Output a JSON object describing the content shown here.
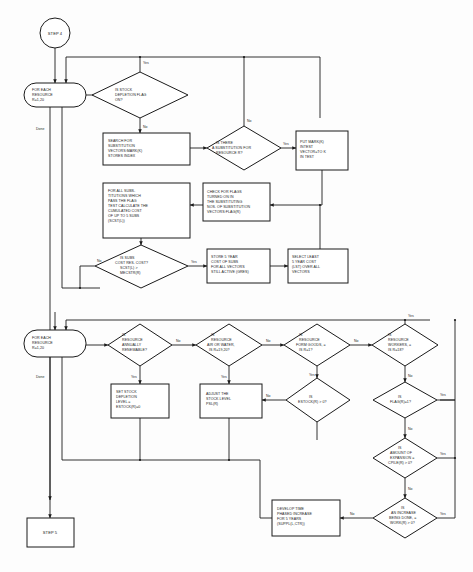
{
  "diagram": {
    "entry_label": "STEP 4",
    "exit_label": "STEP 5",
    "colors": {
      "stroke": "#1b1b1b",
      "fill": "#ffffff",
      "background": "#fdfdfd"
    }
  },
  "nodes": [
    {
      "id": "step4",
      "type": "terminator-circle",
      "lines": [
        "STEP 4"
      ]
    },
    {
      "id": "loop1",
      "type": "loop-capsule",
      "lines": [
        "FOR EACH",
        "RESOURCE",
        "R=1,20"
      ]
    },
    {
      "id": "d_stockflag",
      "type": "decision",
      "lines": [
        "IS STOCK",
        "DEPLETION FLAG",
        "ON?"
      ]
    },
    {
      "id": "p_search",
      "type": "process",
      "lines": [
        "SEARCH FOR",
        "SUBSTITUTION",
        "VECTORS:MARK(K)",
        "STORES INDEX"
      ]
    },
    {
      "id": "d_subexists",
      "type": "decision",
      "lines": [
        "IS THERE",
        "A SUBSTITUTION FOR",
        "RESOURCE R?"
      ]
    },
    {
      "id": "p_putmark",
      "type": "process",
      "lines": [
        "PUT MARK(K)",
        "INTEST",
        "VECTOR=TO K",
        "IN TEST"
      ]
    },
    {
      "id": "p_forallsubs",
      "type": "process",
      "lines": [
        "FOR ALL SUBS-",
        "TITUTIONS WHICH",
        "PASS THE FLAG",
        "TEST CALCULATE THE",
        "CUMULATED COST",
        "OF UP TO 5 SUBS",
        "(SCST(L))"
      ]
    },
    {
      "id": "p_checkflags",
      "type": "process",
      "lines": [
        "CHECK FOR FLAGS",
        "TURNED ON IN",
        "THE SUBSTITUTING",
        "NOS. OF SUBSTITUTION",
        "VECTORS:FLAG(R)"
      ]
    },
    {
      "id": "d_subscost",
      "type": "decision",
      "lines": [
        "IS SUBS",
        "COST RES. COST?",
        "SCST(L) >",
        "MECSTR(R)"
      ]
    },
    {
      "id": "p_store5yr",
      "type": "process",
      "lines": [
        "STORE 5 YEAR",
        "COST OF SUBS",
        "FOR ALL VECTORS",
        "STILL ACTIVE (GRES)"
      ]
    },
    {
      "id": "p_selectleast",
      "type": "process",
      "lines": [
        "SELECT LEAST",
        "5 YEAR COST",
        "(LST) OVER ALL",
        "VECTORS"
      ]
    },
    {
      "id": "loop2",
      "type": "loop-capsule",
      "lines": [
        "FOR EACH",
        "RESOURCE",
        "R=1,20"
      ]
    },
    {
      "id": "d_renewable",
      "type": "decision",
      "lines": [
        "IS",
        "RESOURCE",
        "ANNUALLY",
        "RENEWABLE?"
      ]
    },
    {
      "id": "d_airwater",
      "type": "decision",
      "lines": [
        "IS",
        "RESOURCE",
        "AIR OR WATER,",
        "IS R=19,20?"
      ]
    },
    {
      "id": "d_formgoods",
      "type": "decision",
      "lines": [
        "IS",
        "RESOURCE",
        "FORM GOODS, =",
        "IS R=1?"
      ]
    },
    {
      "id": "d_workers",
      "type": "decision",
      "lines": [
        "IS",
        "RESOURCE",
        "WORKERS, =",
        "IS R=18?"
      ]
    },
    {
      "id": "p_setstock",
      "type": "process",
      "lines": [
        "SET STOCK",
        "DEPLETION",
        "LEVEL =",
        "ESTOCK(R)=0"
      ]
    },
    {
      "id": "p_adjuststock",
      "type": "process",
      "lines": [
        "ADJUST THE",
        "STOCK LEVEL",
        "PSL(R)"
      ]
    },
    {
      "id": "d_estock",
      "type": "decision",
      "lines": [
        "IS",
        "ESTOCK(R) > 0?"
      ]
    },
    {
      "id": "d_flagr",
      "type": "decision",
      "lines": [
        "IS",
        "FLAG(R)=1?"
      ]
    },
    {
      "id": "d_expansion",
      "type": "decision",
      "lines": [
        "IS",
        "AMOUNT OF",
        "EXPANSION =",
        "CPILE(R) > 0?"
      ]
    },
    {
      "id": "d_increase",
      "type": "decision",
      "lines": [
        "IS",
        "AN INCREASE",
        "BEING DONE, =",
        "WORK(R) > 0?"
      ]
    },
    {
      "id": "p_develop",
      "type": "process",
      "lines": [
        "DEVELOP TIME",
        "PHASED INCREASE",
        "FOR 5 YEARS",
        "(SUPPL(L,CTR))"
      ]
    },
    {
      "id": "step5",
      "type": "terminator-box",
      "lines": [
        "STEP 5"
      ]
    }
  ],
  "edge_labels": {
    "yes": "Yes",
    "no": "No",
    "done": "Done"
  }
}
